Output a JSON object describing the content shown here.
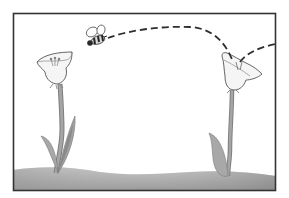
{
  "illustration": {
    "description": "Bee flying along a dashed path from one flower to another above grassy ground",
    "colors": {
      "background": "#ffffff",
      "frame": "#333333",
      "ground_top": "#bdbdbd",
      "ground_bottom": "#8f8f8f",
      "stem": "#9a9a9a",
      "leaf": "#a8a8a8",
      "leaf_dark": "#8a8a8a",
      "petal": "#f4f4f4",
      "outline": "#555555",
      "path": "#333333",
      "bee_body": "#2a2a2a"
    },
    "elements": [
      "frame",
      "ground",
      "left-flower",
      "right-flower",
      "bee",
      "flight-path"
    ]
  }
}
